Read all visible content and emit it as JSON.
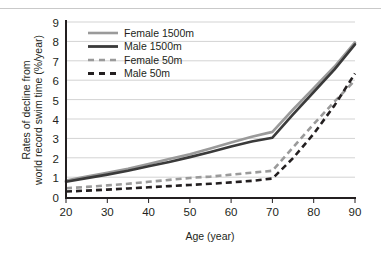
{
  "chart_data": {
    "type": "line",
    "title": "",
    "xlabel": "Age (year)",
    "ylabel": "Rates of decline from world record swim time (%/year)",
    "ylabel_line1": "Rates of decline from",
    "ylabel_line2": "world record swim time (%/year)",
    "xlim": [
      20,
      90
    ],
    "ylim": [
      0,
      9
    ],
    "xticks": [
      20,
      30,
      40,
      50,
      60,
      70,
      80,
      90
    ],
    "yticks": [
      0,
      1,
      2,
      3,
      4,
      5,
      6,
      7,
      8,
      9
    ],
    "grid": "horizontal",
    "legend_position": "top-left-inside",
    "x": [
      20,
      25,
      30,
      35,
      40,
      45,
      50,
      55,
      60,
      65,
      70,
      75,
      80,
      85,
      90
    ],
    "series": [
      {
        "name": "Female 1500m",
        "color": "#9a9a9a",
        "style": "solid",
        "values": [
          0.85,
          1.05,
          1.25,
          1.45,
          1.7,
          1.95,
          2.2,
          2.5,
          2.8,
          3.1,
          3.35,
          4.5,
          5.6,
          6.7,
          7.95
        ]
      },
      {
        "name": "Male 1500m",
        "color": "#3a3a3a",
        "style": "solid",
        "values": [
          0.78,
          0.97,
          1.15,
          1.35,
          1.58,
          1.8,
          2.05,
          2.32,
          2.6,
          2.85,
          3.05,
          4.25,
          5.4,
          6.55,
          7.85
        ]
      },
      {
        "name": "Female 50m",
        "color": "#9a9a9a",
        "style": "dashed",
        "values": [
          0.45,
          0.52,
          0.6,
          0.68,
          0.78,
          0.88,
          0.98,
          1.05,
          1.15,
          1.25,
          1.35,
          2.55,
          3.75,
          4.9,
          6.0
        ]
      },
      {
        "name": "Male 50m",
        "color": "#231f20",
        "style": "dashed",
        "values": [
          0.28,
          0.33,
          0.38,
          0.44,
          0.5,
          0.56,
          0.62,
          0.68,
          0.75,
          0.83,
          0.95,
          2.0,
          3.25,
          4.7,
          6.35
        ]
      }
    ],
    "legend": [
      {
        "label": "Female 1500m",
        "color": "#9a9a9a",
        "style": "solid"
      },
      {
        "label": "Male 1500m",
        "color": "#3a3a3a",
        "style": "solid"
      },
      {
        "label": "Female 50m",
        "color": "#9a9a9a",
        "style": "dashed"
      },
      {
        "label": "Male 50m",
        "color": "#231f20",
        "style": "dashed"
      }
    ]
  },
  "axes": {
    "x_tick_labels": [
      "20",
      "30",
      "40",
      "50",
      "60",
      "70",
      "80",
      "90"
    ],
    "y_tick_labels": [
      "0",
      "1",
      "2",
      "3",
      "4",
      "5",
      "6",
      "7",
      "8",
      "9"
    ]
  },
  "colors": {
    "gridline": "#d3d3d3",
    "axis": "#231f20",
    "female": "#9a9a9a",
    "male_1500": "#3a3a3a",
    "male_50": "#231f20",
    "background": "#ffffff"
  }
}
